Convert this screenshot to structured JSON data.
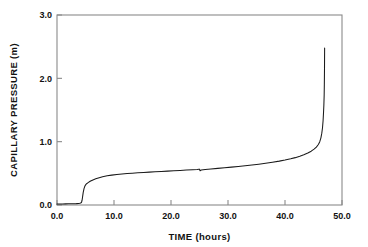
{
  "chart_data": {
    "type": "line",
    "title": "",
    "xlabel": "TIME (hours)",
    "ylabel": "CAPILLARY PRESSURE  (m)",
    "xlim": [
      0.0,
      50.0
    ],
    "ylim": [
      0.0,
      3.0
    ],
    "xticks": [
      "0.0",
      "10.0",
      "20.0",
      "30.0",
      "40.0",
      "50.0"
    ],
    "xtick_values": [
      0,
      10,
      20,
      30,
      40,
      50
    ],
    "yticks": [
      "0.0",
      "1.0",
      "2.0",
      "3.0"
    ],
    "ytick_values": [
      0,
      1,
      2,
      3
    ],
    "grid": false,
    "legend": "none",
    "line_color": "#1a1a1a",
    "frame_color": "#8a8a8a",
    "series": [
      {
        "name": "capillary pressure",
        "x": [
          0.0,
          0.5,
          1.0,
          1.5,
          2.0,
          2.5,
          3.0,
          3.4,
          3.8,
          4.0,
          4.15,
          4.3,
          4.4,
          4.5,
          4.6,
          4.75,
          4.9,
          5.05,
          5.2,
          5.4,
          5.6,
          5.9,
          6.3,
          6.8,
          7.4,
          8.0,
          8.8,
          9.6,
          10.5,
          11.4,
          12.3,
          13.2,
          14.2,
          15.2,
          16.2,
          17.2,
          18.3,
          19.4,
          20.5,
          21.6,
          22.7,
          23.8,
          24.6,
          24.9,
          25.0,
          25.1,
          25.3,
          26.0,
          27.0,
          28.2,
          29.4,
          30.6,
          31.8,
          33.0,
          34.2,
          35.4,
          36.6,
          37.8,
          39.0,
          40.0,
          41.0,
          41.8,
          42.6,
          43.3,
          44.0,
          44.6,
          45.1,
          45.5,
          45.85,
          46.1,
          46.3,
          46.45,
          46.58,
          46.68,
          46.76,
          46.82,
          46.87,
          46.9,
          46.93,
          46.95
        ],
        "y": [
          0.015,
          0.016,
          0.017,
          0.018,
          0.019,
          0.02,
          0.021,
          0.022,
          0.024,
          0.026,
          0.03,
          0.042,
          0.075,
          0.135,
          0.2,
          0.262,
          0.3,
          0.322,
          0.336,
          0.35,
          0.362,
          0.378,
          0.396,
          0.414,
          0.432,
          0.446,
          0.461,
          0.472,
          0.481,
          0.489,
          0.496,
          0.502,
          0.508,
          0.514,
          0.519,
          0.524,
          0.53,
          0.535,
          0.54,
          0.545,
          0.551,
          0.557,
          0.562,
          0.565,
          0.566,
          0.54,
          0.552,
          0.56,
          0.568,
          0.578,
          0.588,
          0.598,
          0.609,
          0.62,
          0.632,
          0.645,
          0.659,
          0.675,
          0.693,
          0.71,
          0.73,
          0.748,
          0.77,
          0.793,
          0.82,
          0.85,
          0.882,
          0.915,
          0.955,
          1.0,
          1.06,
          1.13,
          1.22,
          1.33,
          1.46,
          1.58,
          1.73,
          1.9,
          2.15,
          2.48
        ]
      }
    ]
  }
}
